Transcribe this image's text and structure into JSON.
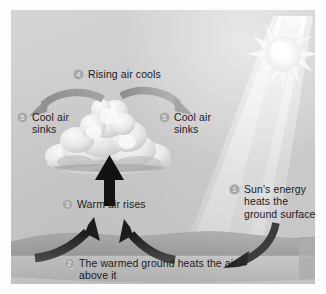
{
  "diagram": {
    "type": "illustrated-process-diagram",
    "background_color": "#cdcdcd",
    "badge_color": "#a8a8a8",
    "text_color": "#1b1b1b"
  },
  "scene": {
    "sun": {
      "icon": "sun-icon",
      "color": "#f2f2f2"
    },
    "light_beam": {
      "icon": "light-beam",
      "color": "#dedede"
    },
    "cloud": {
      "icon": "cumulus-cloud-icon",
      "color": "#ededed"
    },
    "ground": {
      "icon": "ground-slab",
      "color": "#a9a9a9"
    }
  },
  "arrows": {
    "updraft": {
      "name": "warm-air-updraft-arrow",
      "color": "#1a1a1a",
      "direction": "up"
    },
    "ground_left": {
      "name": "ground-heat-arrow-left",
      "color": "#2b2b2b",
      "direction": "up-right"
    },
    "ground_right": {
      "name": "ground-heat-arrow-right",
      "color": "#2b2b2b",
      "direction": "up-left"
    },
    "spread_left": {
      "name": "cool-air-arrow-left",
      "color": "#9a9a9a",
      "direction": "down-left"
    },
    "spread_right": {
      "name": "cool-air-arrow-right",
      "color": "#9a9a9a",
      "direction": "down-right"
    },
    "sun_to_ground": {
      "name": "sun-energy-arrow",
      "color": "#3a3a3a",
      "direction": "down-left"
    }
  },
  "labels": {
    "step1": {
      "number": "1",
      "line1": "Sun's energy",
      "line2": "heats the",
      "line3": "ground surface"
    },
    "step2": {
      "number": "2",
      "line1": "The warmed ground heats the air",
      "line2": "above it"
    },
    "step3": {
      "number": "3",
      "line1": "Warm air rises"
    },
    "step4": {
      "number": "4",
      "line1": "Rising air cools"
    },
    "step5_left": {
      "number": "5",
      "line1": "Cool air",
      "line2": "sinks"
    },
    "step5_right": {
      "number": "5",
      "line1": "Cool air",
      "line2": "sinks"
    }
  }
}
